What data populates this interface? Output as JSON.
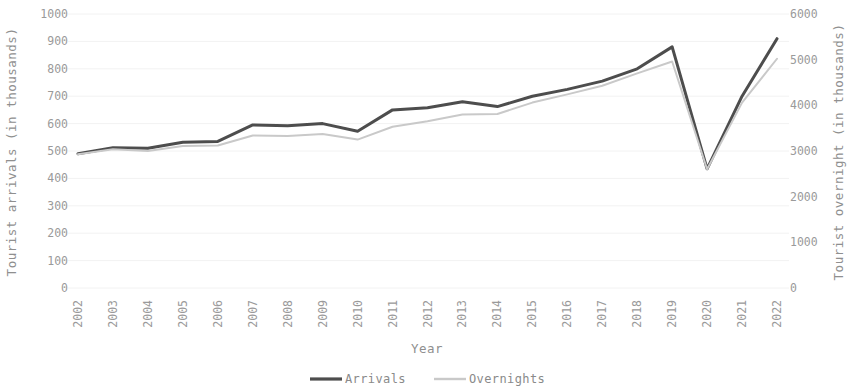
{
  "chart_data": {
    "type": "line",
    "title": "",
    "xlabel": "Year",
    "ylabel": "Tourist arrivals (in thousands)",
    "y2label": "Tourist overnight (in thousands)",
    "x": [
      2002,
      2003,
      2004,
      2005,
      2006,
      2007,
      2008,
      2009,
      2010,
      2011,
      2012,
      2013,
      2014,
      2015,
      2016,
      2017,
      2018,
      2019,
      2020,
      2021,
      2022
    ],
    "categories": [
      "2002",
      "2003",
      "2004",
      "2005",
      "2006",
      "2007",
      "2008",
      "2009",
      "2010",
      "2011",
      "2012",
      "2013",
      "2014",
      "2015",
      "2016",
      "2017",
      "2018",
      "2019",
      "2020",
      "2021",
      "2022"
    ],
    "series": [
      {
        "name": "Arrivals",
        "axis": "left",
        "color": "#4d4d4d",
        "width": 3,
        "values": [
          490,
          512,
          510,
          532,
          535,
          595,
          592,
          600,
          572,
          650,
          658,
          680,
          662,
          700,
          725,
          755,
          800,
          880,
          435,
          700,
          910
        ]
      },
      {
        "name": "Overnights",
        "axis": "right",
        "color": "#c9c9c9",
        "width": 2,
        "values": [
          2930,
          3040,
          3000,
          3110,
          3120,
          3340,
          3330,
          3370,
          3250,
          3530,
          3650,
          3800,
          3810,
          4060,
          4240,
          4430,
          4700,
          4960,
          2600,
          4060,
          5020
        ]
      }
    ],
    "ylim": [
      0,
      1000
    ],
    "yticks": [
      0,
      100,
      200,
      300,
      400,
      500,
      600,
      700,
      800,
      900,
      1000
    ],
    "ytick_labels": [
      "0",
      "100",
      "200",
      "300",
      "400",
      "500",
      "600",
      "700",
      "800",
      "900",
      "1000"
    ],
    "y2lim": [
      0,
      6000
    ],
    "y2ticks": [
      0,
      1000,
      2000,
      3000,
      4000,
      5000,
      6000
    ],
    "y2tick_labels": [
      "0",
      "1000",
      "2000",
      "3000",
      "4000",
      "5000",
      "6000"
    ],
    "grid": true,
    "legend_position": "bottom",
    "legend": [
      "Arrivals",
      "Overnights"
    ]
  },
  "legend": {
    "arrivals_label": "Arrivals",
    "overnights_label": "Overnights"
  },
  "axes": {
    "x_title": "Year",
    "y_left_title": "Tourist arrivals (in thousands)",
    "y_right_title": "Tourist overnight (in thousands)"
  },
  "colors": {
    "arrivals": "#4d4d4d",
    "overnights": "#c9c9c9",
    "grid": "#f2f2f2",
    "text": "#9a9a9a",
    "background": "#ffffff"
  }
}
